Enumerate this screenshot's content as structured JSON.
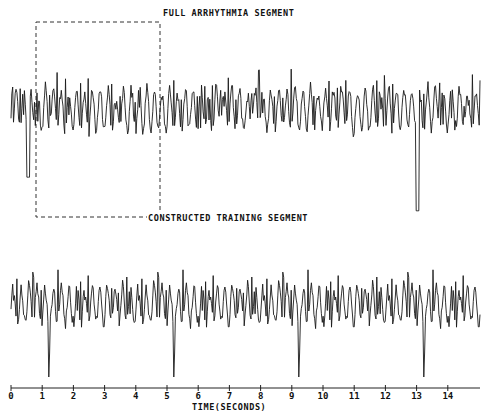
{
  "chart_data": {
    "type": "line",
    "title": "",
    "panels": [
      {
        "name": "Full arrhythmia segment",
        "label": "FULL ARRHYTHMIA SEGMENT",
        "description": "Irregular high-frequency ECG waveform over ~15 seconds, with an annotated dashed box around the region t≈0.8–4.8 s",
        "highlight_box": {
          "x_start_s": 0.8,
          "x_end_s": 4.8,
          "style": "dashed"
        },
        "approx_peaks_time_s": [
          0.3,
          0.9,
          2.0,
          2.4,
          3.0,
          3.6,
          4.5,
          5.2,
          5.9,
          6.5,
          7.2,
          7.8,
          8.4,
          9.0,
          9.3,
          10.0,
          10.4,
          11.2,
          11.6,
          12.2,
          12.7,
          13.3,
          13.9,
          14.8
        ],
        "notable_deep_trough_time_s": 13.0
      },
      {
        "name": "Constructed training segment",
        "label": "CONSTRUCTED TRAINING SEGMENT",
        "description": "Concatenated/repeated copies of the boxed ~4 s excerpt forming a periodic training signal over ~15 seconds",
        "repeat_period_s": 4.0,
        "repeat_boundaries_s": [
          1.2,
          5.2,
          9.1,
          13.1
        ]
      }
    ],
    "xlabel": "TIME(SECONDS)",
    "ylabel": "",
    "x_ticks": [
      "0",
      "1",
      "2",
      "3",
      "4",
      "5",
      "6",
      "7",
      "8",
      "9",
      "10",
      "11",
      "12",
      "13",
      "14"
    ],
    "xlim": [
      0,
      15
    ],
    "grid": false,
    "legend": null
  },
  "labels": {
    "top": "FULL ARRHYTHMIA SEGMENT",
    "bottom": "CONSTRUCTED TRAINING SEGMENT",
    "xaxis": "TIME(SECONDS)"
  },
  "axis": {
    "ticks": [
      "0",
      "1",
      "2",
      "3",
      "4",
      "5",
      "6",
      "7",
      "8",
      "9",
      "10",
      "11",
      "12",
      "13",
      "14"
    ]
  },
  "colors": {
    "trace": "#1a1a1a",
    "background": "#ffffff"
  }
}
